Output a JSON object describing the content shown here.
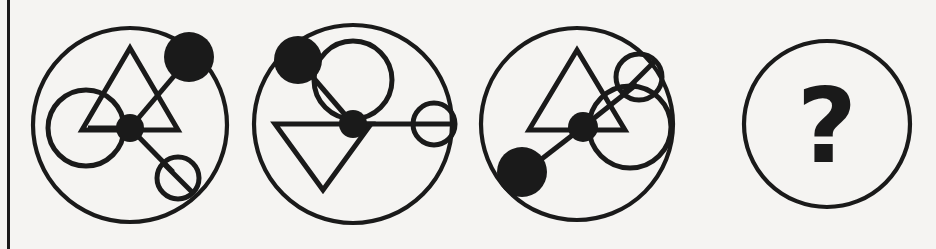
{
  "figure": {
    "background_color": "#f5f4f2",
    "ink_color": "#1a1a1a",
    "width": 936,
    "height": 249,
    "left_rule": {
      "x": 7,
      "width": 3,
      "color": "#1a1a1a"
    },
    "missing_marker": "?"
  },
  "panels": [
    {
      "index": 1,
      "name": "panel-1",
      "outer_circle": {
        "cx": 130,
        "cy": 125,
        "r": 97
      },
      "triangle": {
        "orientation": "apex-up",
        "points": "130,48 178,130 82,130",
        "cx": 130,
        "cy": 103
      },
      "hub": {
        "cx": 130,
        "cy": 128,
        "r": 14,
        "fill": "solid-black"
      },
      "arms": [
        {
          "name": "arm-upper-right",
          "x2": 186,
          "y2": 62,
          "node": {
            "kind": "filled-disc",
            "cx": 189,
            "cy": 57,
            "r": 25
          }
        },
        {
          "name": "arm-left",
          "x2": 88,
          "y2": 128,
          "node": {
            "kind": "open-circle",
            "cx": 86,
            "cy": 128,
            "r": 38
          }
        },
        {
          "name": "arm-lower-right",
          "x2": 173,
          "y2": 172,
          "node": {
            "kind": "slashed-circle",
            "cx": 178,
            "cy": 178,
            "r": 21
          }
        }
      ]
    },
    {
      "index": 2,
      "name": "panel-2",
      "outer_circle": {
        "cx": 353,
        "cy": 124,
        "r": 99
      },
      "triangle": {
        "orientation": "apex-down",
        "points": "323,190 275,124 371,124",
        "cx": 323,
        "cy": 146
      },
      "hub": {
        "cx": 353,
        "cy": 124,
        "r": 14,
        "fill": "solid-black"
      },
      "arms": [
        {
          "name": "arm-upper-left",
          "x2": 305,
          "y2": 68,
          "node": {
            "kind": "filled-disc",
            "cx": 298,
            "cy": 60,
            "r": 24
          }
        },
        {
          "name": "arm-up",
          "x2": 353,
          "y2": 86,
          "node": {
            "kind": "open-circle",
            "cx": 353,
            "cy": 80,
            "r": 39
          }
        },
        {
          "name": "arm-right",
          "x2": 430,
          "y2": 124,
          "node": {
            "kind": "open-circle",
            "cx": 434,
            "cy": 124,
            "r": 21
          }
        }
      ]
    },
    {
      "index": 3,
      "name": "panel-3",
      "outer_circle": {
        "cx": 577,
        "cy": 124,
        "r": 96
      },
      "triangle": {
        "orientation": "apex-up",
        "points": "577,50 625,130 529,130",
        "cx": 577,
        "cy": 105
      },
      "hub": {
        "cx": 583,
        "cy": 127,
        "r": 15,
        "fill": "solid-black"
      },
      "arms": [
        {
          "name": "arm-lower-left",
          "x2": 538,
          "y2": 162,
          "node": {
            "kind": "filled-disc",
            "cx": 522,
            "cy": 172,
            "r": 25
          }
        },
        {
          "name": "arm-right",
          "x2": 620,
          "y2": 127,
          "node": {
            "kind": "open-circle",
            "cx": 630,
            "cy": 127,
            "r": 41
          }
        },
        {
          "name": "arm-upper-right",
          "x2": 635,
          "y2": 86,
          "node": {
            "kind": "slashed-circle",
            "cx": 639,
            "cy": 77,
            "r": 23
          }
        }
      ]
    },
    {
      "index": 4,
      "name": "panel-4-answer",
      "outer_circle": {
        "cx": 827,
        "cy": 124,
        "r": 83
      },
      "triangle": null,
      "hub": null,
      "arms": [],
      "label": "?"
    }
  ]
}
